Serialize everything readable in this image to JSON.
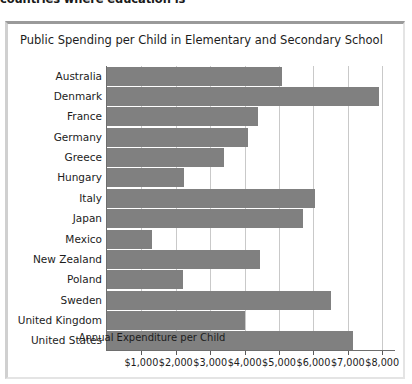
{
  "top_clipped_heading": "countries where education is",
  "chart": {
    "title": "Public Spending per Child in Elementary and Secondary School",
    "bar_color": "#808080",
    "grid_color": "#c9c9c9",
    "axis_color": "#6e6e6e"
  },
  "chart_data": {
    "type": "bar",
    "orientation": "horizontal",
    "title": "Public Spending per Child in Elementary and Secondary School",
    "xlabel": "Annual Expenditure per Child",
    "ylabel": "",
    "categories": [
      "Australia",
      "Denmark",
      "France",
      "Germany",
      "Greece",
      "Hungary",
      "Italy",
      "Japan",
      "Mexico",
      "New Zealand",
      "Poland",
      "Sweden",
      "United Kingdom",
      "United States"
    ],
    "values": [
      5100,
      7900,
      4400,
      4100,
      3400,
      2250,
      6050,
      5700,
      1300,
      4450,
      2200,
      6500,
      4000,
      7150
    ],
    "xlim": [
      0,
      8400
    ],
    "xticks": [
      1000,
      2000,
      3000,
      4000,
      5000,
      6000,
      7000,
      8000
    ],
    "xtick_labels": [
      "$1,000",
      "$2,000",
      "$3,000",
      "$4,000",
      "$5,000",
      "$6,000",
      "$7,000",
      "$8,000"
    ],
    "grid": "vertical",
    "legend": null
  }
}
